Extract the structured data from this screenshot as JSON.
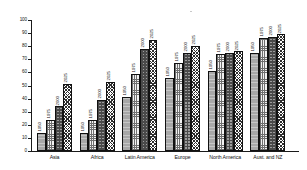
{
  "chart_data": {
    "type": "bar",
    "title": "",
    "subtitle": "",
    "xlabel": "",
    "ylabel": "",
    "ylim": [
      0,
      100
    ],
    "ytick_step": 10,
    "yticks": [
      0,
      10,
      20,
      30,
      40,
      50,
      60,
      70,
      80,
      90,
      100
    ],
    "grid": false,
    "legend_position": "none",
    "bar_value_labels": true,
    "bar_label_mode": "series-year",
    "categories": [
      "Asia",
      "Africa",
      "Latin America",
      "Europe",
      "North America",
      "Aust. and NZ"
    ],
    "series": [
      {
        "name": "1950",
        "values": [
          14,
          14,
          41,
          56,
          61,
          75
        ],
        "fill": "solid-gray",
        "color": "#a8a8a8"
      },
      {
        "name": "1975",
        "values": [
          24,
          24,
          59,
          67,
          74,
          86
        ],
        "fill": "light-checker",
        "color": "#f2f2f2"
      },
      {
        "name": "2000",
        "values": [
          34,
          39,
          78,
          75,
          75,
          87
        ],
        "fill": "dark-dotted",
        "color": "#9c9c9c"
      },
      {
        "name": "2025",
        "values": [
          51,
          53,
          85,
          80,
          76,
          89
        ],
        "fill": "diagonal-crosshatch",
        "color": "#ffffff"
      }
    ]
  },
  "axis": {
    "y_tick_labels": [
      "0",
      "10",
      "20",
      "30",
      "40",
      "50",
      "60",
      "70",
      "80",
      "90",
      "100"
    ],
    "axis_color": "#1a1a1a"
  }
}
